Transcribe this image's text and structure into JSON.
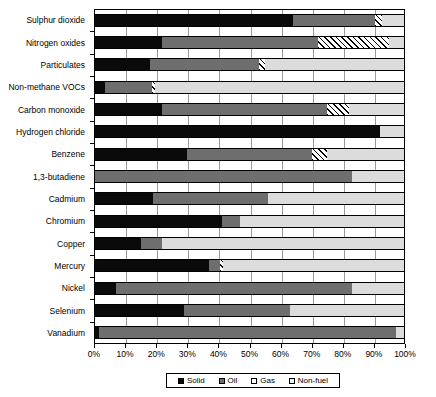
{
  "chart_data": {
    "type": "bar",
    "orientation": "horizontal",
    "stacked": true,
    "stack_mode": "percent",
    "title": "",
    "xlabel": "",
    "ylabel": "",
    "xlim": [
      0,
      100
    ],
    "xtick_labels": [
      "0%",
      "10%",
      "20%",
      "30%",
      "40%",
      "50%",
      "60%",
      "70%",
      "80%",
      "90%",
      "100%"
    ],
    "xtick_values": [
      0,
      10,
      20,
      30,
      40,
      50,
      60,
      70,
      80,
      90,
      100
    ],
    "grid": true,
    "legend_position": "bottom",
    "categories": [
      "Sulphur dioxide",
      "Nitrogen oxides",
      "Particulates",
      "Non-methane VOCs",
      "Carbon monoxide",
      "Hydrogen chloride",
      "Benzene",
      "1,3-butadiene",
      "Cadmium",
      "Chromium",
      "Copper",
      "Mercury",
      "Nickel",
      "Selenium",
      "Vanadium"
    ],
    "series": [
      {
        "name": "Solid",
        "color": "#0a0a0a",
        "values": [
          64,
          22,
          18,
          3.5,
          22,
          92,
          30,
          0,
          19,
          41,
          15,
          37,
          7,
          29,
          1.5
        ]
      },
      {
        "name": "Oil",
        "color": "#6e6e6e",
        "values": [
          26.5,
          50,
          35,
          15,
          53,
          0,
          40,
          83,
          37,
          6,
          7,
          3.5,
          76,
          34,
          95.5
        ]
      },
      {
        "name": "Gas",
        "color": "#ffffff",
        "values": [
          2,
          23,
          2,
          1,
          7,
          0,
          5,
          0,
          0,
          0,
          0,
          1,
          0,
          0,
          0
        ]
      },
      {
        "name": "Non-fuel",
        "color": "#dcdcdc",
        "values": [
          7.5,
          5,
          45,
          80.5,
          18,
          8,
          25,
          17,
          44,
          53,
          78,
          58.5,
          17,
          37,
          3
        ]
      }
    ]
  },
  "legend": {
    "items": [
      {
        "label": "Solid",
        "swatch": "#0a0a0a"
      },
      {
        "label": "Oil",
        "swatch": "#6e6e6e"
      },
      {
        "label": "Gas",
        "swatch": "#ffffff"
      },
      {
        "label": "Non-fuel",
        "swatch": "#efefef"
      }
    ]
  }
}
